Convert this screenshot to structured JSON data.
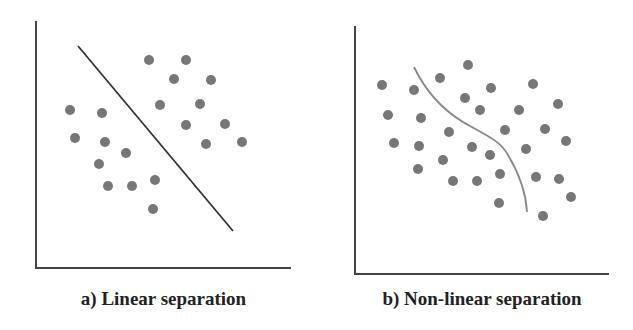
{
  "figure": {
    "panels": [
      {
        "id": "a",
        "caption": "a) Linear separation",
        "axes": {
          "origin": [
            36,
            268
          ],
          "y_top": 21,
          "x_right": 291
        },
        "separator": {
          "type": "line",
          "from": [
            78,
            46
          ],
          "to": [
            233,
            231
          ],
          "color": "#333333"
        },
        "points": [
          [
            149,
            60
          ],
          [
            186,
            60
          ],
          [
            174,
            79
          ],
          [
            211,
            80
          ],
          [
            160,
            105
          ],
          [
            200,
            104
          ],
          [
            186,
            125
          ],
          [
            225,
            124
          ],
          [
            206,
            144
          ],
          [
            242,
            142
          ],
          [
            70,
            110
          ],
          [
            102,
            113
          ],
          [
            75,
            138
          ],
          [
            105,
            142
          ],
          [
            126,
            153
          ],
          [
            99,
            164
          ],
          [
            108,
            186
          ],
          [
            132,
            186
          ],
          [
            155,
            180
          ],
          [
            153,
            209
          ]
        ]
      },
      {
        "id": "b",
        "caption": "b) Non-linear separation",
        "axes": {
          "origin": [
            355,
            274
          ],
          "y_top": 26,
          "x_right": 609
        },
        "separator": {
          "type": "curve",
          "path": "M414,67 C425,90 440,108 463,122 C485,135 500,140 508,155 C520,175 526,195 527,212",
          "color": "#888888"
        },
        "points": [
          [
            468,
            65
          ],
          [
            440,
            78
          ],
          [
            382,
            85
          ],
          [
            414,
            90
          ],
          [
            491,
            88
          ],
          [
            533,
            84
          ],
          [
            465,
            98
          ],
          [
            480,
            110
          ],
          [
            519,
            110
          ],
          [
            558,
            104
          ],
          [
            388,
            115
          ],
          [
            421,
            118
          ],
          [
            449,
            132
          ],
          [
            505,
            130
          ],
          [
            545,
            129
          ],
          [
            394,
            143
          ],
          [
            419,
            146
          ],
          [
            472,
            147
          ],
          [
            526,
            149
          ],
          [
            566,
            141
          ],
          [
            490,
            155
          ],
          [
            443,
            160
          ],
          [
            418,
            169
          ],
          [
            500,
            174
          ],
          [
            536,
            177
          ],
          [
            559,
            179
          ],
          [
            453,
            181
          ],
          [
            477,
            181
          ],
          [
            571,
            197
          ],
          [
            499,
            203
          ],
          [
            543,
            216
          ]
        ]
      }
    ],
    "colors": {
      "point": "#777777",
      "axis": "#444444",
      "background": "#ffffff"
    }
  }
}
